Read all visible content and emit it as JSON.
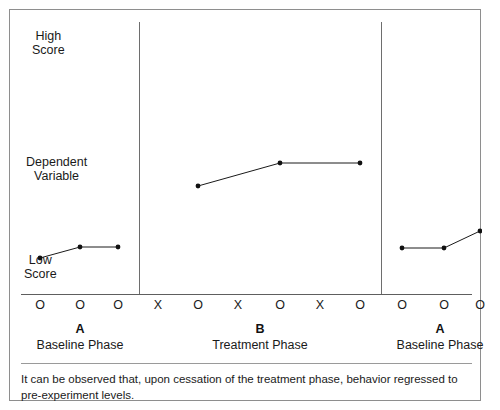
{
  "figure": {
    "note": "It can be observed that, upon cessation of the treatment phase, behavior regressed to pre-experiment levels.",
    "border_color": "#8e8e8e"
  },
  "axis": {
    "high_label": "High\nScore",
    "middle_label": "Dependent\nVariable",
    "low_label": "Low\nScore",
    "axis_color": "#5e5e5e",
    "divider_color": "#6e6e6e"
  },
  "ticks": [
    {
      "label": "O",
      "x": 30
    },
    {
      "label": "O",
      "x": 70
    },
    {
      "label": "O",
      "x": 108
    },
    {
      "label": "X",
      "x": 148
    },
    {
      "label": "O",
      "x": 188
    },
    {
      "label": "X",
      "x": 228
    },
    {
      "label": "O",
      "x": 270
    },
    {
      "label": "X",
      "x": 310
    },
    {
      "label": "O",
      "x": 350
    },
    {
      "label": "O",
      "x": 392
    },
    {
      "label": "O",
      "x": 434
    },
    {
      "label": "O",
      "x": 470
    }
  ],
  "phases": [
    {
      "letter": "A",
      "name": "Baseline Phase",
      "center": 70
    },
    {
      "letter": "B",
      "name": "Treatment Phase",
      "center": 250
    },
    {
      "letter": "A",
      "name": "Baseline Phase",
      "center": 430
    }
  ],
  "dividers": [
    {
      "x": 129,
      "height": 272
    },
    {
      "x": 371,
      "height": 272
    }
  ],
  "chart_data": {
    "type": "line",
    "title": "",
    "xlabel": "",
    "ylabel": "Dependent Variable",
    "grid": false,
    "legend": "none",
    "y_anchor_labels": [
      "High Score",
      "Dependent Variable",
      "Low Score"
    ],
    "x_tick_labels": [
      "O",
      "O",
      "O",
      "X",
      "O",
      "X",
      "O",
      "X",
      "O",
      "O",
      "O",
      "O"
    ],
    "phase_labels": [
      "A Baseline Phase",
      "B Treatment Phase",
      "A Baseline Phase"
    ],
    "series": [
      {
        "name": "A Baseline Phase",
        "points": [
          {
            "x": 30,
            "y": 248,
            "tick": "O"
          },
          {
            "x": 70,
            "y": 237,
            "tick": "O"
          },
          {
            "x": 108,
            "y": 237,
            "tick": "O"
          }
        ]
      },
      {
        "name": "B Treatment Phase",
        "points": [
          {
            "x": 188,
            "y": 176,
            "tick": "O"
          },
          {
            "x": 270,
            "y": 153,
            "tick": "O"
          },
          {
            "x": 350,
            "y": 153,
            "tick": "O"
          }
        ]
      },
      {
        "name": "A Baseline Phase (return)",
        "points": [
          {
            "x": 392,
            "y": 238,
            "tick": "O"
          },
          {
            "x": 434,
            "y": 238,
            "tick": "O"
          },
          {
            "x": 470,
            "y": 221,
            "tick": "O"
          }
        ]
      }
    ]
  }
}
